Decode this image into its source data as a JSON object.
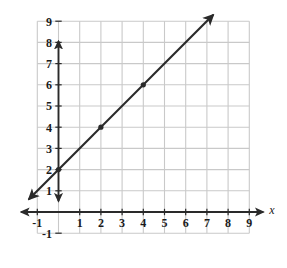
{
  "chart_data": {
    "type": "line",
    "title": "",
    "xlabel": "x",
    "ylabel": "",
    "xlim": [
      -1,
      9
    ],
    "ylim": [
      -1,
      9
    ],
    "grid": true,
    "legend": null,
    "x_ticks": [
      -1,
      1,
      2,
      3,
      4,
      5,
      6,
      7,
      8,
      9
    ],
    "y_ticks": [
      -1,
      1,
      2,
      3,
      4,
      5,
      6,
      7,
      8,
      9
    ],
    "x_tick_labels": [
      "-1",
      "1",
      "2",
      "3",
      "4",
      "5",
      "6",
      "7",
      "8",
      "9"
    ],
    "y_tick_labels": [
      "-1",
      "1",
      "2",
      "3",
      "4",
      "5",
      "6",
      "7",
      "8",
      "9"
    ],
    "series": [
      {
        "name": "line",
        "equation": "y = x + 2",
        "slope": 1,
        "intercept": 2,
        "double_arrow": true,
        "x": [
          -1.4,
          7.3
        ],
        "y": [
          0.6,
          9.3
        ],
        "marked_points": [
          {
            "x": 0,
            "y": 2
          },
          {
            "x": 2,
            "y": 4
          },
          {
            "x": 4,
            "y": 6
          }
        ]
      }
    ],
    "colors": {
      "grid": "#c9c9c9",
      "axis": "#2a2a2a",
      "line": "#2a2a2a",
      "background": "#ffffff",
      "text": "#1a1a1a"
    }
  },
  "labels": {
    "x_axis_label": "x",
    "y_axis_label": ""
  }
}
